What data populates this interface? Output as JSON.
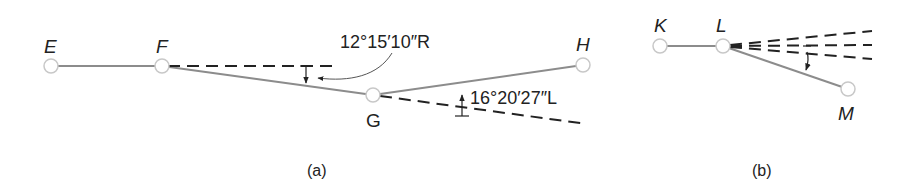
{
  "figure_a": {
    "caption": "(a)",
    "points": {
      "E": {
        "label": "E"
      },
      "F": {
        "label": "F"
      },
      "G": {
        "label": "G"
      },
      "H": {
        "label": "H"
      }
    },
    "deflection_angles": {
      "at_F": "12°15′10″R",
      "at_G": "16°20′27″L"
    }
  },
  "figure_b": {
    "caption": "(b)",
    "points": {
      "K": {
        "label": "K"
      },
      "L": {
        "label": "L"
      },
      "M": {
        "label": "M"
      }
    }
  },
  "colors": {
    "line": "#8c8c8c",
    "dashed": "#222222",
    "text": "#222222",
    "node_fill": "#ffffff",
    "node_stroke": "#c8c8c8"
  }
}
